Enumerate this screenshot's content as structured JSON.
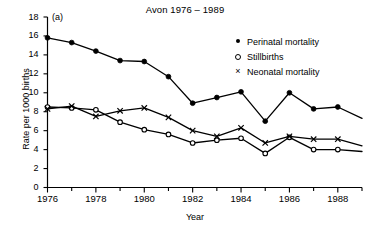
{
  "chart_data": {
    "type": "line",
    "title": "Avon 1976 – 1989",
    "panel_label": "(a)",
    "xlabel": "Year",
    "ylabel": "Rate per 1000 births",
    "xlim": [
      1976,
      1989
    ],
    "ylim": [
      0,
      18
    ],
    "grid": false,
    "legend_position": "top-right",
    "x": [
      1976,
      1977,
      1978,
      1979,
      1980,
      1981,
      1982,
      1983,
      1984,
      1985,
      1986,
      1987,
      1988,
      1989
    ],
    "xticks_major": [
      1976,
      1978,
      1980,
      1982,
      1984,
      1986,
      1988
    ],
    "xtick_labels": [
      "1976",
      "1978",
      "1980",
      "1982",
      "1984",
      "1986",
      "1988"
    ],
    "xticks_minor": [
      1977,
      1979,
      1981,
      1983,
      1985,
      1987,
      1989
    ],
    "yticks": [
      0,
      2,
      4,
      6,
      8,
      10,
      12,
      14,
      16,
      18
    ],
    "ytick_labels": [
      "0",
      "2",
      "4",
      "6",
      "8",
      "10",
      "12",
      "14",
      "16",
      "18"
    ],
    "series": [
      {
        "name": "Perinatal mortality",
        "marker": "filled-circle",
        "values": [
          15.8,
          15.3,
          14.4,
          13.4,
          13.3,
          11.7,
          8.9,
          9.5,
          10.1,
          7.0,
          10.0,
          8.3,
          8.5,
          7.3
        ],
        "last_point_unmarked": true
      },
      {
        "name": "Stillbirths",
        "marker": "open-circle",
        "values": [
          8.5,
          8.4,
          8.2,
          6.9,
          6.1,
          5.6,
          4.7,
          5.0,
          5.2,
          3.6,
          5.3,
          4.0,
          4.0,
          3.8
        ],
        "last_point_unmarked": true
      },
      {
        "name": "Neonatal mortality",
        "marker": "cross",
        "values": [
          8.3,
          8.6,
          7.5,
          8.1,
          8.4,
          7.4,
          6.0,
          5.4,
          6.3,
          4.7,
          5.4,
          5.1,
          5.1,
          4.4
        ],
        "last_point_unmarked": true
      }
    ]
  },
  "legend": {
    "items": [
      {
        "marker_name": "filled-circle-marker",
        "marker_glyph": "●",
        "label": "Perinatal mortality"
      },
      {
        "marker_name": "open-circle-marker",
        "marker_glyph": "○",
        "label": "Stillbirths"
      },
      {
        "marker_name": "cross-marker",
        "marker_glyph": "×",
        "label": "Neonatal mortality"
      }
    ]
  },
  "colors": {
    "ink": "#000000",
    "background": "#ffffff"
  }
}
